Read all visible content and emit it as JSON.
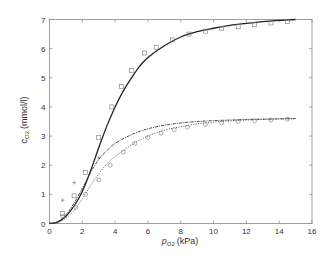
{
  "chart_data": {
    "type": "line",
    "title": "",
    "xlabel": "p_O2 (kPa)",
    "ylabel": "c_O2 (mmol/l)",
    "xlabel_main": "p",
    "xlabel_sub": "O2",
    "xlabel_unit": "(kPa)",
    "ylabel_main": "c",
    "ylabel_sub": "O2",
    "ylabel_unit": "(mmol/l)",
    "xlim": [
      0,
      16
    ],
    "ylim": [
      0,
      7
    ],
    "xticks": [
      0,
      2,
      4,
      6,
      8,
      10,
      12,
      14,
      16
    ],
    "yticks": [
      0,
      1,
      2,
      3,
      4,
      5,
      6,
      7
    ],
    "grid": false,
    "legend": null,
    "series": [
      {
        "name": "upper fit (solid)",
        "style": "solid",
        "x": [
          0,
          0.5,
          1,
          1.5,
          2,
          2.5,
          3,
          3.5,
          4,
          4.5,
          5,
          5.5,
          6,
          7,
          8,
          9,
          10,
          11,
          12,
          13,
          14,
          15
        ],
        "y": [
          0,
          0.05,
          0.25,
          0.6,
          1.1,
          1.8,
          2.6,
          3.35,
          4.0,
          4.55,
          5.0,
          5.4,
          5.7,
          6.1,
          6.4,
          6.58,
          6.7,
          6.8,
          6.87,
          6.93,
          6.97,
          7.0
        ]
      },
      {
        "name": "upper data (squares)",
        "style": "marker-square",
        "x": [
          0.8,
          1.5,
          2.2,
          3.0,
          3.8,
          4.4,
          5.0,
          5.8,
          6.5,
          7.5,
          8.5,
          9.5,
          10.5,
          11.5,
          12.5,
          13.5,
          14.5
        ],
        "y": [
          0.35,
          0.95,
          1.75,
          2.95,
          4.0,
          4.7,
          5.25,
          5.85,
          6.05,
          6.3,
          6.5,
          6.6,
          6.7,
          6.75,
          6.82,
          6.88,
          6.93
        ]
      },
      {
        "name": "middle fit (dash-dot)",
        "style": "dashdot",
        "x": [
          0,
          0.5,
          1,
          1.5,
          2,
          2.5,
          3,
          3.5,
          4,
          5,
          6,
          7,
          8,
          9,
          10,
          11,
          12,
          13,
          14,
          15
        ],
        "y": [
          0,
          0.06,
          0.3,
          0.7,
          1.2,
          1.75,
          2.2,
          2.5,
          2.75,
          3.05,
          3.25,
          3.37,
          3.45,
          3.5,
          3.53,
          3.55,
          3.57,
          3.58,
          3.59,
          3.6
        ]
      },
      {
        "name": "middle data (plus)",
        "style": "marker-plus",
        "x": [
          0.8,
          1.5,
          3.0
        ],
        "y": [
          0.8,
          1.4,
          2.25
        ]
      },
      {
        "name": "lower fit (dotted)",
        "style": "dotted",
        "x": [
          0,
          0.5,
          1,
          1.5,
          2,
          2.5,
          3,
          3.5,
          4,
          5,
          6,
          7,
          8,
          9,
          10,
          11,
          12,
          13,
          14,
          15
        ],
        "y": [
          0,
          0.04,
          0.18,
          0.45,
          0.85,
          1.3,
          1.7,
          2.05,
          2.3,
          2.7,
          3.0,
          3.2,
          3.32,
          3.42,
          3.48,
          3.52,
          3.55,
          3.57,
          3.59,
          3.6
        ]
      },
      {
        "name": "lower data (circles)",
        "style": "marker-circle",
        "x": [
          0.8,
          1.6,
          2.2,
          3.0,
          3.7,
          4.5,
          5.2,
          6.0,
          6.8,
          7.6,
          8.4,
          9.5,
          10.5,
          11.5,
          12.5,
          13.5,
          14.5
        ],
        "y": [
          0.25,
          0.55,
          1.0,
          1.5,
          2.0,
          2.45,
          2.75,
          2.95,
          3.1,
          3.22,
          3.3,
          3.4,
          3.45,
          3.5,
          3.52,
          3.55,
          3.58
        ]
      }
    ]
  }
}
